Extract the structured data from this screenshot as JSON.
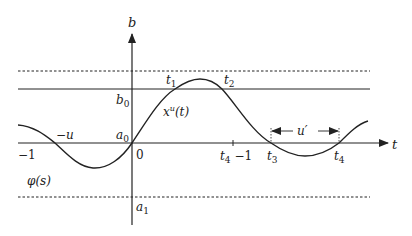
{
  "diagram": {
    "axes": {
      "vertical_label": "b",
      "horizontal_label": "t"
    },
    "lines": {
      "upper_dashed": "upper bound (dashed)",
      "b0_line": "b0 level (solid)",
      "lower_dashed": "lower bound (dashed)"
    },
    "labels": {
      "b0": "b",
      "b0_sub": "0",
      "a0": "a",
      "a0_sub": "0",
      "a1": "a",
      "a1_sub": "1",
      "t1": "t",
      "t1_sub": "1",
      "t2": "t",
      "t2_sub": "2",
      "t3": "t",
      "t3_sub": "3",
      "t4": "t",
      "t4_sub": "4",
      "t4_minus_1_t": "t",
      "t4_minus_1_sub": "4",
      "t4_minus_1_rest": " −1",
      "curve_x": "x",
      "curve_sup": "u",
      "curve_arg": "(t)",
      "phi": "φ(s)",
      "neg_u": "−u",
      "neg_one": "−1",
      "zero": "0",
      "u_prime": "u′"
    },
    "colors": {
      "stroke": "#222222",
      "background": "#ffffff"
    }
  }
}
